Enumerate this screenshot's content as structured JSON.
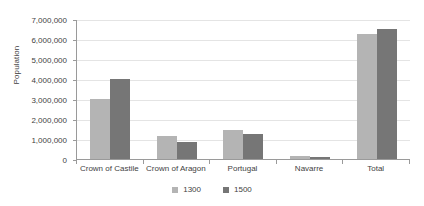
{
  "chart_data": {
    "type": "bar",
    "title": "",
    "xlabel": "",
    "ylabel": "Population",
    "categories": [
      "Crown of Castile",
      "Crown of Aragon",
      "Portugal",
      "Navarre",
      "Total"
    ],
    "series": [
      {
        "name": "1300",
        "color": "#b4b4b4",
        "values": [
          3000000,
          1150000,
          1450000,
          150000,
          6250000
        ]
      },
      {
        "name": "1500",
        "color": "#767676",
        "values": [
          4000000,
          850000,
          1250000,
          80000,
          6500000
        ]
      }
    ],
    "ylim": [
      0,
      7000000
    ],
    "ytick_labels": [
      "0",
      "1,000,000",
      "2,000,000",
      "3,000,000",
      "4,000,000",
      "5,000,000",
      "6,000,000",
      "7,000,000"
    ],
    "ytick_values": [
      0,
      1000000,
      2000000,
      3000000,
      4000000,
      5000000,
      6000000,
      7000000
    ],
    "grid": true,
    "legend_position": "bottom"
  },
  "legend": {
    "items": [
      {
        "label": "1300",
        "color": "#b4b4b4"
      },
      {
        "label": "1500",
        "color": "#767676"
      }
    ]
  }
}
